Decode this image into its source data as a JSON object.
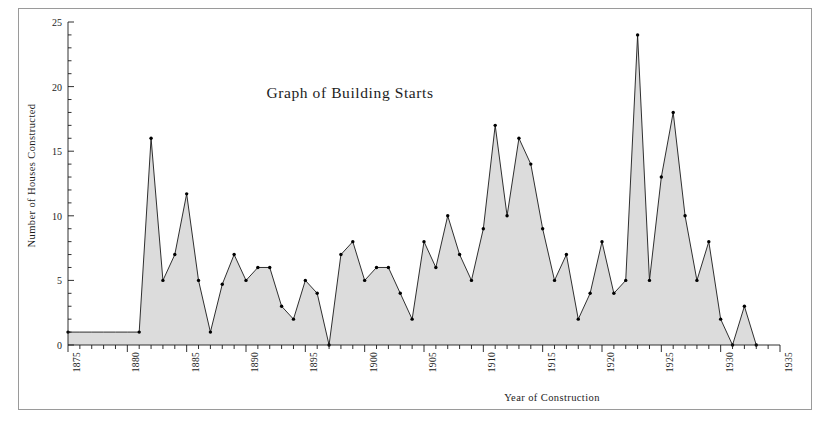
{
  "figure": {
    "title": "Graph of Building Starts",
    "xlabel": "Year of Construction",
    "ylabel": "Number of Houses Constructed"
  },
  "axes": {
    "y_ticks": [
      0,
      5,
      10,
      15,
      20,
      25
    ],
    "y_tick_labels": [
      "0",
      "5",
      "10",
      "15",
      "20",
      "25"
    ],
    "x_ticks": [
      1875,
      1880,
      1885,
      1890,
      1895,
      1900,
      1905,
      1910,
      1915,
      1920,
      1925,
      1930,
      1935
    ],
    "x_tick_labels": [
      "1875",
      "1880",
      "1885",
      "1890",
      "1895",
      "1900",
      "1905",
      "1910",
      "1915",
      "1920",
      "1925",
      "1930",
      "1935"
    ],
    "xlim": [
      1875,
      1935
    ],
    "ylim": [
      0,
      25
    ],
    "y_minor_step": 1,
    "x_minor_step": 1
  },
  "style": {
    "fill_color": "#dcdcdc",
    "line_color": "#1a1a1a",
    "marker_color": "#000000",
    "frame_color": "#9a9a9a",
    "background": "#ffffff"
  },
  "chart_data": {
    "type": "area",
    "title": "Graph of Building Starts",
    "xlabel": "Year of Construction",
    "ylabel": "Number of Houses Constructed",
    "xlim": [
      1875,
      1935
    ],
    "ylim": [
      0,
      25
    ],
    "grid": false,
    "legend": null,
    "x": [
      1875,
      1876,
      1877,
      1878,
      1879,
      1880,
      1881,
      1882,
      1883,
      1884,
      1885,
      1886,
      1887,
      1888,
      1889,
      1890,
      1891,
      1892,
      1893,
      1894,
      1895,
      1896,
      1897,
      1898,
      1899,
      1900,
      1901,
      1902,
      1903,
      1904,
      1905,
      1906,
      1907,
      1908,
      1909,
      1910,
      1911,
      1912,
      1913,
      1914,
      1915,
      1916,
      1917,
      1918,
      1919,
      1920,
      1921,
      1922,
      1923,
      1924,
      1925,
      1926,
      1927,
      1928,
      1929,
      1930,
      1931,
      1932,
      1933
    ],
    "values": [
      1,
      1,
      1,
      1,
      1,
      1,
      1,
      16,
      5,
      7,
      11.7,
      5,
      1,
      4.7,
      7,
      5,
      6,
      6,
      3,
      2,
      5,
      4,
      0,
      7,
      8,
      5,
      6,
      6,
      4,
      2,
      8,
      6,
      10,
      7,
      5,
      9,
      17,
      10,
      16,
      14,
      9,
      5,
      7,
      2,
      4,
      8,
      4,
      5,
      24,
      5,
      13,
      18,
      10,
      5,
      8,
      2,
      0,
      3,
      0
    ],
    "series": [
      {
        "name": "Houses Constructed",
        "values": [
          1,
          1,
          1,
          1,
          1,
          1,
          1,
          16,
          5,
          7,
          11.7,
          5,
          1,
          4.7,
          7,
          5,
          6,
          6,
          3,
          2,
          5,
          4,
          0,
          7,
          8,
          5,
          6,
          6,
          4,
          2,
          8,
          6,
          10,
          7,
          5,
          9,
          17,
          10,
          16,
          14,
          9,
          5,
          7,
          2,
          4,
          8,
          4,
          5,
          24,
          5,
          13,
          18,
          10,
          5,
          8,
          2,
          0,
          3,
          0
        ]
      }
    ],
    "notable_points": [
      {
        "year": 1882,
        "value": 16
      },
      {
        "year": 1885,
        "value": 11.7
      },
      {
        "year": 1910,
        "value": 17
      },
      {
        "year": 1912,
        "value": 16
      },
      {
        "year": 1922,
        "value": 24
      },
      {
        "year": 1925,
        "value": 18
      }
    ]
  }
}
